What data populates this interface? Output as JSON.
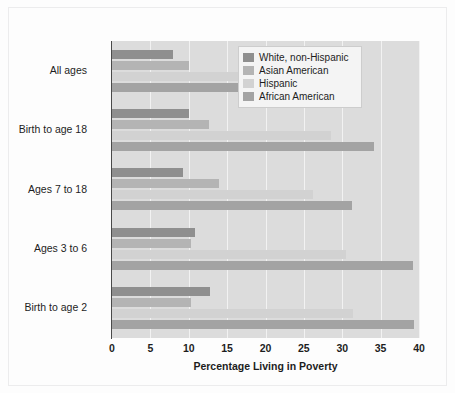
{
  "chart_data": {
    "type": "bar",
    "orientation": "horizontal",
    "title": "",
    "xlabel": "Percentage Living in Poverty",
    "ylabel": "",
    "xlim": [
      0,
      40
    ],
    "xticks": [
      0,
      5,
      10,
      15,
      20,
      25,
      30,
      35,
      40
    ],
    "xtick_labels": [
      "0",
      "5",
      "10",
      "15",
      "20",
      "25",
      "30",
      "35",
      "40"
    ],
    "grid": true,
    "grid_axis": "x",
    "legend_position": "top-right",
    "categories": [
      "All ages",
      "Birth to age 18",
      "Ages 7 to 18",
      "Ages 3 to 6",
      "Birth to age 2"
    ],
    "series": [
      {
        "name": "White, non-Hispanic",
        "color": "#8f8f8f",
        "values": [
          8.0,
          10.0,
          9.2,
          10.8,
          12.8
        ]
      },
      {
        "name": "Asian American",
        "color": "#b4b4b4",
        "values": [
          10.0,
          12.7,
          14.0,
          10.3,
          10.3
        ]
      },
      {
        "name": "Hispanic",
        "color": "#d2d2d2",
        "values": [
          22.0,
          28.5,
          26.2,
          30.5,
          31.4
        ]
      },
      {
        "name": "African American",
        "color": "#a3a3a3",
        "values": [
          24.2,
          34.2,
          31.3,
          39.2,
          39.4
        ]
      }
    ]
  },
  "figure": {
    "background_color": "#fdfdfd",
    "plot_background_color": "#dcdcdc",
    "axis_color": "#4a4a4a",
    "gridline_color": "#f2f2f2"
  }
}
